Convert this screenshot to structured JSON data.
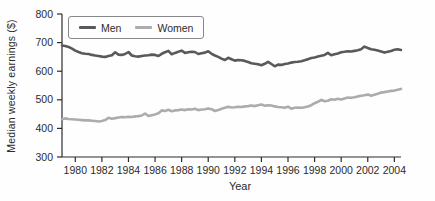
{
  "chart_data": {
    "type": "line",
    "title": "",
    "xlabel": "Year",
    "ylabel": "Median weekly earnings ($)",
    "ylim": [
      300,
      800
    ],
    "y_ticks": [
      300,
      400,
      500,
      600,
      700,
      800
    ],
    "x_ticks": [
      1980,
      1982,
      1984,
      1986,
      1988,
      1990,
      1992,
      1994,
      1996,
      1998,
      2000,
      2002,
      2004
    ],
    "x_start": 1979.0,
    "x_step": 0.25,
    "grid": false,
    "legend_position": "top-left",
    "axis_color": "#2d2a2b",
    "series": [
      {
        "name": "Men",
        "color": "#58595b",
        "values": [
          690,
          688,
          685,
          679,
          672,
          667,
          663,
          661,
          660,
          657,
          655,
          653,
          651,
          650,
          653,
          656,
          666,
          658,
          657,
          660,
          667,
          655,
          652,
          651,
          653,
          655,
          656,
          658,
          657,
          653,
          661,
          666,
          671,
          659,
          664,
          668,
          672,
          664,
          666,
          668,
          667,
          660,
          663,
          665,
          670,
          661,
          655,
          650,
          644,
          639,
          647,
          642,
          637,
          639,
          638,
          636,
          632,
          628,
          626,
          624,
          621,
          626,
          633,
          625,
          617,
          623,
          622,
          625,
          627,
          630,
          632,
          633,
          635,
          638,
          642,
          646,
          648,
          651,
          654,
          657,
          664,
          656,
          659,
          662,
          666,
          668,
          670,
          669,
          671,
          673,
          677,
          686,
          681,
          677,
          675,
          672,
          669,
          665,
          668,
          671,
          675,
          677,
          674
        ]
      },
      {
        "name": "Women",
        "color": "#aaacae",
        "values": [
          432,
          435,
          433,
          432,
          431,
          430,
          429,
          428,
          428,
          427,
          426,
          424,
          426,
          429,
          437,
          434,
          436,
          438,
          440,
          439,
          441,
          440,
          442,
          443,
          445,
          452,
          443,
          446,
          449,
          453,
          463,
          461,
          465,
          460,
          463,
          464,
          466,
          464,
          467,
          466,
          469,
          464,
          466,
          467,
          470,
          467,
          461,
          464,
          469,
          472,
          476,
          473,
          474,
          476,
          475,
          477,
          478,
          480,
          478,
          481,
          484,
          479,
          481,
          480,
          477,
          475,
          474,
          472,
          476,
          469,
          472,
          473,
          472,
          474,
          477,
          481,
          488,
          493,
          500,
          495,
          497,
          502,
          500,
          504,
          501,
          505,
          508,
          507,
          509,
          512,
          514,
          516,
          519,
          514,
          518,
          521,
          525,
          527,
          529,
          531,
          532,
          535,
          538
        ]
      }
    ]
  }
}
